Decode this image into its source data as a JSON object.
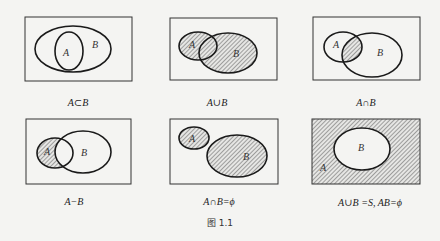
{
  "figure": {
    "caption": "图 1.1",
    "line_color": "#1a1a1a",
    "hatch_color": "#555555",
    "background": "#f4f4f2",
    "panels": [
      {
        "id": "subset",
        "caption": "A⊂B",
        "label_a": "A",
        "label_b": "B",
        "shaded": "none",
        "rect": {
          "x": 25,
          "y": 17,
          "w": 107,
          "h": 64
        },
        "ellipse_a": {
          "cx": 69,
          "cy": 51,
          "rx": 14,
          "ry": 19
        },
        "ellipse_b": {
          "cx": 73,
          "cy": 49,
          "rx": 38,
          "ry": 23
        }
      },
      {
        "id": "union",
        "caption": "A∪B",
        "label_a": "A",
        "label_b": "B",
        "shaded": "A ∪ B",
        "rect": {
          "x": 170,
          "y": 18,
          "w": 107,
          "h": 62
        },
        "ellipse_a": {
          "cx": 198,
          "cy": 46,
          "rx": 19,
          "ry": 14
        },
        "ellipse_b": {
          "cx": 228,
          "cy": 53,
          "rx": 29,
          "ry": 20
        }
      },
      {
        "id": "intersection",
        "caption": "A∩B",
        "label_a": "A",
        "label_b": "B",
        "shaded": "A ∩ B",
        "rect": {
          "x": 313,
          "y": 17,
          "w": 107,
          "h": 63
        },
        "ellipse_a": {
          "cx": 343,
          "cy": 47,
          "rx": 19,
          "ry": 15
        },
        "ellipse_b": {
          "cx": 372,
          "cy": 55,
          "rx": 30,
          "ry": 22
        }
      },
      {
        "id": "difference",
        "caption": "A−B",
        "label_a": "A",
        "label_b": "B",
        "shaded": "A − B",
        "rect": {
          "x": 26,
          "y": 119,
          "w": 105,
          "h": 65
        },
        "ellipse_a": {
          "cx": 55,
          "cy": 153,
          "rx": 18,
          "ry": 15
        },
        "ellipse_b": {
          "cx": 83,
          "cy": 152,
          "rx": 28,
          "ry": 21
        }
      },
      {
        "id": "disjoint",
        "caption": "A∩B=ϕ",
        "label_a": "A",
        "label_b": "B",
        "shaded": "A and B",
        "rect": {
          "x": 170,
          "y": 119,
          "w": 108,
          "h": 65
        },
        "ellipse_a": {
          "cx": 194,
          "cy": 138,
          "rx": 15,
          "ry": 11
        },
        "ellipse_b": {
          "cx": 237,
          "cy": 156,
          "rx": 30,
          "ry": 21
        }
      },
      {
        "id": "complement",
        "caption": "A∪B =S, AB=ϕ",
        "label_a": "A",
        "label_b": "B",
        "shaded": "S − B (= A)",
        "rect": {
          "x": 312,
          "y": 119,
          "w": 108,
          "h": 65
        },
        "ellipse_b": {
          "cx": 362,
          "cy": 149,
          "rx": 28,
          "ry": 21
        }
      }
    ]
  }
}
